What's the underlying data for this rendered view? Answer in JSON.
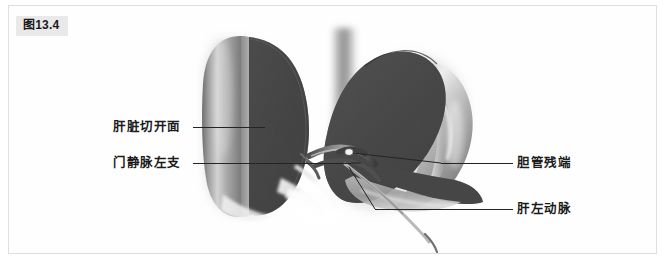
{
  "figure": {
    "number_label": "图13.4",
    "caption_present": false
  },
  "illustration": {
    "title": "肝脏切开面解剖示意图",
    "subject": "liver-transection-anatomy",
    "view": "anterior",
    "colors": {
      "panel_background": "#fefefe",
      "panel_border": "#dedede",
      "badge_background": "#e9e9e9",
      "badge_text": "#1a1a1a",
      "liver_surface_light": "#c9c9c9",
      "liver_surface_mid": "#8e8e8e",
      "liver_surface_dark": "#5c5c5c",
      "cut_surface": "#3b3b3b",
      "cut_surface_edge": "#2a2a2a",
      "vessel_dark": "#4a4a4a",
      "vessel_light": "#d5d5d5",
      "leader_line": "#242424",
      "highlight": "#f2f2f2"
    },
    "structures": [
      {
        "name": "left-liver-lobe",
        "描述": "左肝叶外侧面与切开断面"
      },
      {
        "name": "right-liver-lobe",
        "描述": "右肝叶断面呈叶状"
      },
      {
        "name": "inferior-vena-cava",
        "描述": "下腔静脉（两叶之间的纵行结构）"
      },
      {
        "name": "hilar-vessels",
        "描述": "肝门部血管束"
      }
    ]
  },
  "annotations": {
    "cut_surface": {
      "label": "肝脏切开面",
      "side": "left"
    },
    "portal_vein": {
      "label": "门静脉左支",
      "side": "left"
    },
    "bile_duct_stump": {
      "label": "胆管残端",
      "side": "right"
    },
    "left_hepatic_artery": {
      "label": "肝左动脉",
      "side": "right"
    }
  }
}
